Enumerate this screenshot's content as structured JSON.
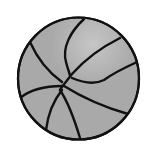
{
  "image": {
    "subject": "basketball",
    "style": "grayscale clip-art",
    "colors": {
      "background": "#ffffff",
      "ball_fill": "#a9a9a9",
      "highlight": "#c4c4c4",
      "outline": "#111111"
    }
  }
}
